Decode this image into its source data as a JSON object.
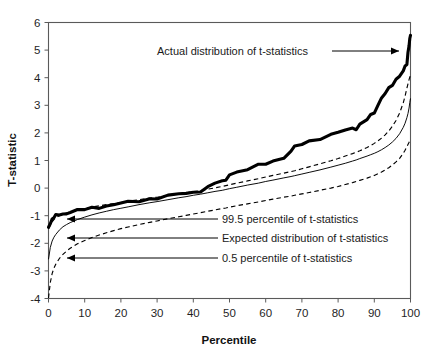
{
  "figure": {
    "background_color": "#ffffff",
    "foreground_color": "#000000"
  },
  "chart_data": {
    "type": "line",
    "title": "",
    "subtitle": "",
    "xlabel": "Percentile",
    "ylabel": "T-statistic",
    "xlim": [
      0,
      100
    ],
    "ylim": [
      -4,
      6
    ],
    "xticks": [
      0,
      10,
      20,
      30,
      40,
      50,
      60,
      70,
      80,
      90,
      100
    ],
    "yticks": [
      -4,
      -3,
      -2,
      -1,
      0,
      1,
      2,
      3,
      4,
      5,
      6
    ],
    "xtick_labels": [
      "0",
      "10",
      "20",
      "30",
      "40",
      "50",
      "60",
      "70",
      "80",
      "90",
      "100"
    ],
    "ytick_labels": [
      "-4",
      "-3",
      "-2",
      "-1",
      "0",
      "1",
      "2",
      "3",
      "4",
      "5",
      "6"
    ],
    "grid": false,
    "legend_position": "none",
    "x": [
      0,
      0.5,
      1,
      1.5,
      2,
      3,
      4,
      5,
      6,
      8,
      10,
      12,
      14,
      16,
      18,
      20,
      22,
      25,
      28,
      30,
      33,
      36,
      38,
      40,
      42,
      44,
      46,
      48,
      49,
      50,
      52,
      55,
      58,
      60,
      62,
      65,
      67,
      68,
      70,
      72,
      75,
      78,
      80,
      82,
      84,
      85,
      86,
      88,
      89,
      90,
      91,
      92,
      93,
      94,
      95,
      96,
      97,
      98,
      98.5,
      99,
      99.3,
      99.6,
      99.8,
      100
    ],
    "series": [
      {
        "name": "Actual distribution of t-statistics",
        "style": "solid-thick",
        "values": [
          -1.42,
          -1.25,
          -1.12,
          -1.05,
          -1.02,
          -0.97,
          -0.94,
          -0.9,
          -0.86,
          -0.82,
          -0.78,
          -0.73,
          -0.68,
          -0.64,
          -0.6,
          -0.56,
          -0.52,
          -0.45,
          -0.39,
          -0.35,
          -0.29,
          -0.23,
          -0.19,
          -0.15,
          -0.08,
          0.02,
          0.18,
          0.22,
          0.3,
          0.52,
          0.58,
          0.68,
          0.8,
          0.88,
          0.98,
          1.12,
          1.35,
          1.48,
          1.58,
          1.68,
          1.82,
          1.95,
          2.02,
          2.08,
          2.14,
          2.16,
          2.32,
          2.52,
          2.62,
          2.7,
          3.0,
          3.28,
          3.48,
          3.6,
          3.72,
          3.9,
          4.08,
          4.28,
          4.42,
          4.48,
          4.85,
          5.18,
          5.42,
          5.58
        ]
      },
      {
        "name": "99.5 percentile of t-statistics",
        "style": "dashed",
        "values": [
          -1.48,
          -1.34,
          -1.22,
          -1.14,
          -1.08,
          -1.0,
          -0.95,
          -0.9,
          -0.86,
          -0.8,
          -0.74,
          -0.69,
          -0.64,
          -0.6,
          -0.56,
          -0.52,
          -0.48,
          -0.42,
          -0.36,
          -0.33,
          -0.27,
          -0.21,
          -0.17,
          -0.13,
          -0.09,
          -0.04,
          0.01,
          0.06,
          0.09,
          0.12,
          0.18,
          0.26,
          0.34,
          0.4,
          0.46,
          0.54,
          0.6,
          0.63,
          0.7,
          0.77,
          0.88,
          0.99,
          1.07,
          1.16,
          1.25,
          1.3,
          1.35,
          1.47,
          1.54,
          1.62,
          1.71,
          1.81,
          1.93,
          2.07,
          2.24,
          2.45,
          2.72,
          3.09,
          3.33,
          3.62,
          3.78,
          3.93,
          4.02,
          4.08
        ]
      },
      {
        "name": "Expected distribution of t-statistics",
        "style": "solid-thin",
        "values": [
          -2.58,
          -2.15,
          -1.92,
          -1.78,
          -1.68,
          -1.52,
          -1.4,
          -1.32,
          -1.25,
          -1.14,
          -1.05,
          -0.97,
          -0.9,
          -0.84,
          -0.78,
          -0.73,
          -0.68,
          -0.6,
          -0.53,
          -0.49,
          -0.42,
          -0.35,
          -0.31,
          -0.26,
          -0.22,
          -0.17,
          -0.12,
          -0.08,
          -0.05,
          -0.02,
          0.03,
          0.11,
          0.18,
          0.24,
          0.29,
          0.37,
          0.42,
          0.45,
          0.51,
          0.57,
          0.66,
          0.76,
          0.83,
          0.9,
          0.98,
          1.02,
          1.07,
          1.16,
          1.21,
          1.26,
          1.32,
          1.39,
          1.47,
          1.56,
          1.67,
          1.8,
          1.97,
          2.2,
          2.35,
          2.55,
          2.7,
          2.9,
          3.1,
          3.25
        ]
      },
      {
        "name": "0.5 percentile of t-statistics",
        "style": "dashed",
        "values": [
          -3.98,
          -3.42,
          -3.1,
          -2.9,
          -2.76,
          -2.55,
          -2.4,
          -2.28,
          -2.18,
          -2.02,
          -1.9,
          -1.79,
          -1.7,
          -1.62,
          -1.54,
          -1.47,
          -1.41,
          -1.32,
          -1.24,
          -1.19,
          -1.11,
          -1.04,
          -0.99,
          -0.94,
          -0.89,
          -0.84,
          -0.79,
          -0.74,
          -0.72,
          -0.69,
          -0.64,
          -0.57,
          -0.5,
          -0.45,
          -0.4,
          -0.33,
          -0.29,
          -0.26,
          -0.21,
          -0.16,
          -0.08,
          0.0,
          0.06,
          0.13,
          0.2,
          0.24,
          0.28,
          0.36,
          0.41,
          0.46,
          0.52,
          0.58,
          0.66,
          0.74,
          0.84,
          0.95,
          1.08,
          1.26,
          1.37,
          1.5,
          1.58,
          1.66,
          1.72,
          1.76
        ]
      }
    ],
    "annotations": [
      {
        "name": "actual-distribution",
        "text": "Actual distribution of t-statistics",
        "arrow_direction": "right"
      },
      {
        "name": "upper-percentile",
        "text": "99.5 percentile of t-statistics",
        "arrow_direction": "left"
      },
      {
        "name": "expected-distribution",
        "text": "Expected distribution of t-statistics",
        "arrow_direction": "left"
      },
      {
        "name": "lower-percentile",
        "text": "0.5 percentile of t-statistics",
        "arrow_direction": "left"
      }
    ]
  }
}
